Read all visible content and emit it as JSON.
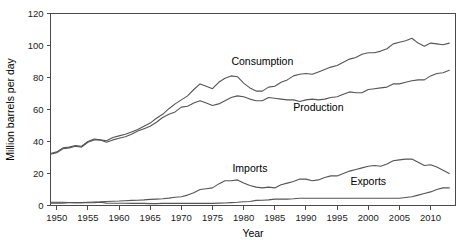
{
  "chart_data": {
    "type": "line",
    "title": "",
    "xlabel": "Year",
    "ylabel": "Million barrels per day",
    "xlim": [
      1949,
      2014
    ],
    "ylim": [
      0,
      120
    ],
    "xticks": [
      1950,
      1955,
      1960,
      1965,
      1970,
      1975,
      1980,
      1985,
      1990,
      1995,
      2000,
      2005,
      2010
    ],
    "yticks": [
      0,
      20,
      40,
      60,
      80,
      100,
      120
    ],
    "grid": false,
    "legend_position": "inline-annotations",
    "line_color": "#555555",
    "axis_color": "#4a4a4a",
    "text_color": "#000000",
    "x": [
      1949,
      1950,
      1951,
      1952,
      1953,
      1954,
      1955,
      1956,
      1957,
      1958,
      1959,
      1960,
      1961,
      1962,
      1963,
      1964,
      1965,
      1966,
      1967,
      1968,
      1969,
      1970,
      1971,
      1972,
      1973,
      1974,
      1975,
      1976,
      1977,
      1978,
      1979,
      1980,
      1981,
      1982,
      1983,
      1984,
      1985,
      1986,
      1987,
      1988,
      1989,
      1990,
      1991,
      1992,
      1993,
      1994,
      1995,
      1996,
      1997,
      1998,
      1999,
      2000,
      2001,
      2002,
      2003,
      2004,
      2005,
      2006,
      2007,
      2008,
      2009,
      2010,
      2011,
      2012,
      2013
    ],
    "series": [
      {
        "name": "Consumption",
        "label": "Consumption",
        "label_x": 1983,
        "label_y": 88,
        "values": [
          32.5,
          33.5,
          36.0,
          36.5,
          37.5,
          37.0,
          40.0,
          41.5,
          41.0,
          40.5,
          42.5,
          43.5,
          44.5,
          46.0,
          47.5,
          49.5,
          51.5,
          54.5,
          57.0,
          60.5,
          63.5,
          66.0,
          68.5,
          72.5,
          76.0,
          74.5,
          73.0,
          77.0,
          79.5,
          81.0,
          80.5,
          76.5,
          73.5,
          71.5,
          71.5,
          74.0,
          74.5,
          77.0,
          78.5,
          81.0,
          82.0,
          82.5,
          82.0,
          83.5,
          85.0,
          86.5,
          87.5,
          89.5,
          91.5,
          92.5,
          94.5,
          95.5,
          95.5,
          96.5,
          98.0,
          101.0,
          102.0,
          103.0,
          104.5,
          101.5,
          99.5,
          101.5,
          101.0,
          100.5,
          101.5
        ]
      },
      {
        "name": "Production",
        "label": "Production",
        "label_x": 1992,
        "label_y": 59,
        "values": [
          32.0,
          33.0,
          35.5,
          36.0,
          37.0,
          36.5,
          39.5,
          41.0,
          41.0,
          39.5,
          41.0,
          42.0,
          43.0,
          44.5,
          46.5,
          48.0,
          49.5,
          52.0,
          55.0,
          57.0,
          58.5,
          61.5,
          62.0,
          64.0,
          65.5,
          64.0,
          62.5,
          63.5,
          65.5,
          67.5,
          68.5,
          68.0,
          66.5,
          65.5,
          65.5,
          67.5,
          67.0,
          66.5,
          66.0,
          66.0,
          65.0,
          66.0,
          66.5,
          66.0,
          66.5,
          67.5,
          68.0,
          69.5,
          71.0,
          70.5,
          70.5,
          72.5,
          73.0,
          73.5,
          74.0,
          76.0,
          76.0,
          77.0,
          78.0,
          78.5,
          78.5,
          81.0,
          82.5,
          83.0,
          84.5
        ]
      },
      {
        "name": "Imports",
        "label": "Imports",
        "label_x": 1981,
        "label_y": 21,
        "values": [
          1.5,
          1.5,
          1.5,
          1.7,
          1.8,
          1.8,
          2.0,
          2.2,
          2.3,
          2.5,
          2.7,
          2.8,
          3.0,
          3.2,
          3.3,
          3.5,
          3.8,
          4.0,
          4.2,
          4.6,
          5.2,
          5.5,
          6.5,
          8.0,
          10.0,
          10.5,
          11.0,
          13.5,
          15.5,
          15.5,
          16.0,
          14.0,
          12.5,
          11.5,
          11.0,
          11.5,
          11.0,
          13.0,
          14.0,
          15.0,
          16.5,
          16.5,
          15.5,
          16.0,
          17.5,
          18.5,
          18.5,
          20.0,
          21.5,
          22.5,
          23.5,
          24.5,
          25.0,
          24.5,
          26.0,
          28.0,
          28.5,
          29.0,
          29.0,
          27.0,
          25.0,
          25.5,
          24.0,
          22.0,
          20.0
        ]
      },
      {
        "name": "Exports",
        "label": "Exports",
        "label_x": 2000,
        "label_y": 13,
        "values": [
          2.0,
          2.0,
          2.0,
          1.9,
          1.8,
          1.7,
          1.7,
          1.8,
          2.0,
          1.5,
          1.4,
          1.4,
          1.4,
          1.3,
          1.3,
          1.3,
          1.2,
          1.2,
          1.3,
          1.3,
          1.3,
          1.3,
          1.3,
          1.3,
          1.3,
          1.3,
          1.3,
          1.5,
          1.6,
          1.8,
          2.0,
          2.3,
          2.5,
          3.2,
          3.3,
          3.5,
          4.0,
          4.0,
          4.0,
          4.2,
          4.5,
          4.5,
          4.5,
          4.5,
          4.5,
          4.5,
          4.5,
          4.5,
          4.5,
          4.5,
          4.5,
          4.5,
          4.5,
          4.5,
          4.5,
          4.5,
          4.5,
          5.0,
          5.5,
          6.5,
          7.5,
          8.5,
          10.0,
          11.0,
          11.0
        ]
      }
    ]
  }
}
